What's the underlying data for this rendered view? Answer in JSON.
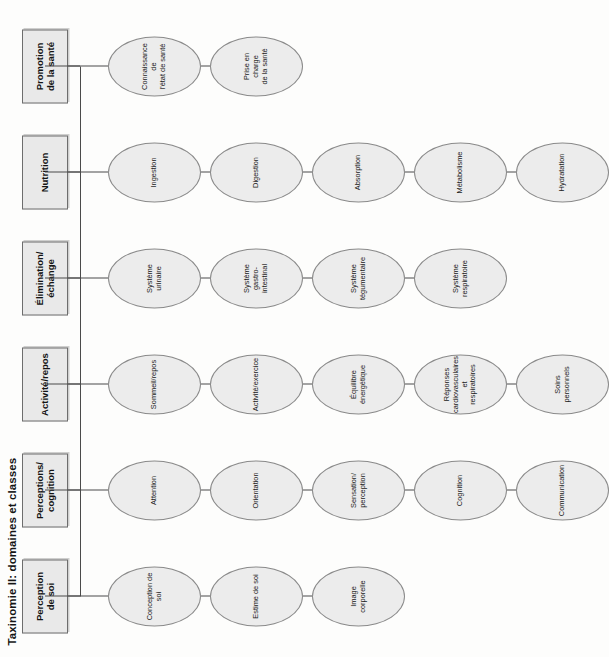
{
  "title": "Taxinomie II: domaines et classes",
  "colors": {
    "node_fill": "#e9e9e9",
    "node_stroke": "#6d6d6d",
    "ellipse_fill": "#ececec",
    "ellipse_stroke": "#8a8a8a",
    "connector": "#4a4a4a",
    "text": "#141414",
    "background": "#fdfdfc"
  },
  "diagram": {
    "type": "hierarchy-tree",
    "orientation": "rotated-90-ccw",
    "domains": [
      {
        "id": "perception-de-soi",
        "label": "Perception\nde soi",
        "label_lines": [
          "Perception",
          "de soi"
        ],
        "classes": [
          {
            "label_lines": [
              "Conception de soi"
            ]
          },
          {
            "label_lines": [
              "Estime de soi"
            ]
          },
          {
            "label_lines": [
              "Image corporelle"
            ]
          }
        ]
      },
      {
        "id": "perceptions-cognition",
        "label": "Perceptions/\ncognition",
        "label_lines": [
          "Perceptions/",
          "cognition"
        ],
        "classes": [
          {
            "label_lines": [
              "Attention"
            ]
          },
          {
            "label_lines": [
              "Orientation"
            ]
          },
          {
            "label_lines": [
              "Sensation/",
              "perception"
            ]
          },
          {
            "label_lines": [
              "Cognition"
            ]
          },
          {
            "label_lines": [
              "Communication"
            ]
          }
        ]
      },
      {
        "id": "activite-repos",
        "label": "Activité/repos",
        "label_lines": [
          "Activité/repos"
        ],
        "classes": [
          {
            "label_lines": [
              "Sommeil/repos"
            ]
          },
          {
            "label_lines": [
              "Activité/exercice"
            ]
          },
          {
            "label_lines": [
              "Équilibre",
              "énergétique"
            ]
          },
          {
            "label_lines": [
              "Réponses",
              "cardiovasculaires et",
              "respiratoires"
            ]
          },
          {
            "label_lines": [
              "Soins personnels"
            ]
          }
        ]
      },
      {
        "id": "elimination-echange",
        "label": "Élimination/\néchange",
        "label_lines": [
          "Élimination/",
          "échange"
        ],
        "classes": [
          {
            "label_lines": [
              "Système",
              "urinaire"
            ]
          },
          {
            "label_lines": [
              "Système",
              "gastro-intestinal"
            ]
          },
          {
            "label_lines": [
              "Système",
              "tégumentaire"
            ]
          },
          {
            "label_lines": [
              "Système",
              "respiratoire"
            ]
          }
        ]
      },
      {
        "id": "nutrition",
        "label": "Nutrition",
        "label_lines": [
          "Nutrition"
        ],
        "classes": [
          {
            "label_lines": [
              "Ingestion"
            ]
          },
          {
            "label_lines": [
              "Digestion"
            ]
          },
          {
            "label_lines": [
              "Absorption"
            ]
          },
          {
            "label_lines": [
              "Métabolisme"
            ]
          },
          {
            "label_lines": [
              "Hydratation"
            ]
          }
        ]
      },
      {
        "id": "promotion-de-la-sante",
        "label": "Promotion\nde la santé",
        "label_lines": [
          "Promotion",
          "de la santé"
        ],
        "classes": [
          {
            "label_lines": [
              "Connaissance de",
              "l'état de santé"
            ]
          },
          {
            "label_lines": [
              "Prise en charge",
              "de la santé"
            ]
          }
        ]
      }
    ]
  }
}
